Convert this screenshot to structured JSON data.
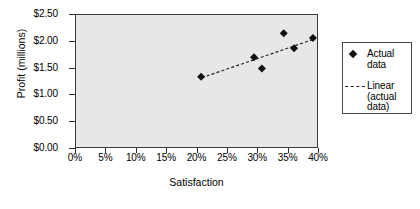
{
  "chart_data": {
    "type": "scatter",
    "title": "",
    "xlabel": "Satisfaction",
    "ylabel": "Profit (millions)",
    "xlim": [
      0,
      40
    ],
    "ylim": [
      0,
      2.5
    ],
    "x_tick_labels": [
      "0%",
      "5%",
      "10%",
      "15%",
      "20%",
      "25%",
      "30%",
      "35%",
      "40%"
    ],
    "x_tick_values": [
      0,
      5,
      10,
      15,
      20,
      25,
      30,
      35,
      40
    ],
    "y_tick_labels": [
      "$0.00",
      "$0.50",
      "$1.00",
      "$1.50",
      "$2.00",
      "$2.50"
    ],
    "y_tick_values": [
      0,
      0.5,
      1.0,
      1.5,
      2.0,
      2.5
    ],
    "grid": false,
    "plot_background": "#e7e7e7",
    "marker_color": "#111111",
    "trendline_color": "#222222",
    "legend_position": "right",
    "series": [
      {
        "name": "Actual data",
        "type": "scatter",
        "marker": "diamond",
        "x": [
          20.6,
          29.3,
          30.6,
          34.2,
          35.9,
          39.0
        ],
        "y": [
          1.35,
          1.71,
          1.5,
          2.16,
          1.88,
          2.07
        ]
      },
      {
        "name": "Linear (actual data)",
        "type": "line",
        "style": "dashed",
        "x": [
          20.7,
          39.2
        ],
        "y": [
          1.33,
          2.05
        ]
      }
    ]
  },
  "legend": {
    "entries": [
      {
        "label": "Actual\ndata",
        "key": "diamond-marker"
      },
      {
        "label": "Linear\n(actual\ndata)",
        "key": "dashed-line"
      }
    ]
  }
}
